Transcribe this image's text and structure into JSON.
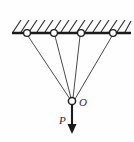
{
  "figure": {
    "background_color": "#fefefe",
    "ink_color": "#1a1a1a",
    "cord_color": "#4a4a4a"
  },
  "ceiling": {
    "name": "hatched-ceiling",
    "bar": {
      "x1": 12,
      "y1": 33,
      "x2": 131,
      "y2": 33,
      "thickness": 2.6
    },
    "hatching": {
      "direction": "lower-left-to-upper-right",
      "count": 15,
      "spacing": 8,
      "height": 12,
      "lean": 8
    }
  },
  "anchors": [
    {
      "label": "anchor-1",
      "cx": 27,
      "cy": 33,
      "r": 3.4
    },
    {
      "label": "anchor-2",
      "cx": 54,
      "cy": 33,
      "r": 3.4
    },
    {
      "label": "anchor-3",
      "cx": 81,
      "cy": 33,
      "r": 3.4
    },
    {
      "label": "anchor-4",
      "cx": 113,
      "cy": 33,
      "r": 3.4
    }
  ],
  "junction": {
    "label": "O",
    "cx": 72,
    "cy": 101,
    "r": 3.6,
    "label_x": 79,
    "label_y": 106
  },
  "cords": [
    {
      "name": "cord-1",
      "x1": 28,
      "y1": 36,
      "x2": 70,
      "y2": 99
    },
    {
      "name": "cord-2",
      "x1": 55,
      "y1": 36,
      "x2": 71,
      "y2": 98
    },
    {
      "name": "cord-3",
      "x1": 80,
      "y1": 36,
      "x2": 73,
      "y2": 98
    },
    {
      "name": "cord-4",
      "x1": 112,
      "y1": 36,
      "x2": 75,
      "y2": 99
    }
  ],
  "force": {
    "label": "P",
    "label_x": 60,
    "label_y": 123,
    "shaft": {
      "x1": 72,
      "y1": 105,
      "x2": 72,
      "y2": 126
    },
    "head": {
      "points": "67.5,124 76.5,124 72,134"
    },
    "direction": "down"
  }
}
